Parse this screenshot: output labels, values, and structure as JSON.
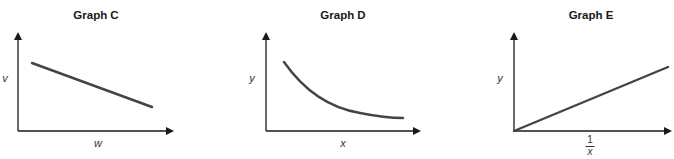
{
  "graphs": [
    {
      "title": "Graph C",
      "ylabel": "v",
      "xlabel": "w",
      "shape": "straight line, negative slope"
    },
    {
      "title": "Graph D",
      "ylabel": "y",
      "xlabel": "x",
      "shape": "decreasing curve (inverse relationship)"
    },
    {
      "title": "Graph E",
      "ylabel": "y",
      "xlabel_numerator": "1",
      "xlabel_denominator": "x",
      "shape": "straight line through origin, positive slope"
    }
  ],
  "colors": {
    "axis": "#1a1a1a",
    "curve": "#444444"
  }
}
